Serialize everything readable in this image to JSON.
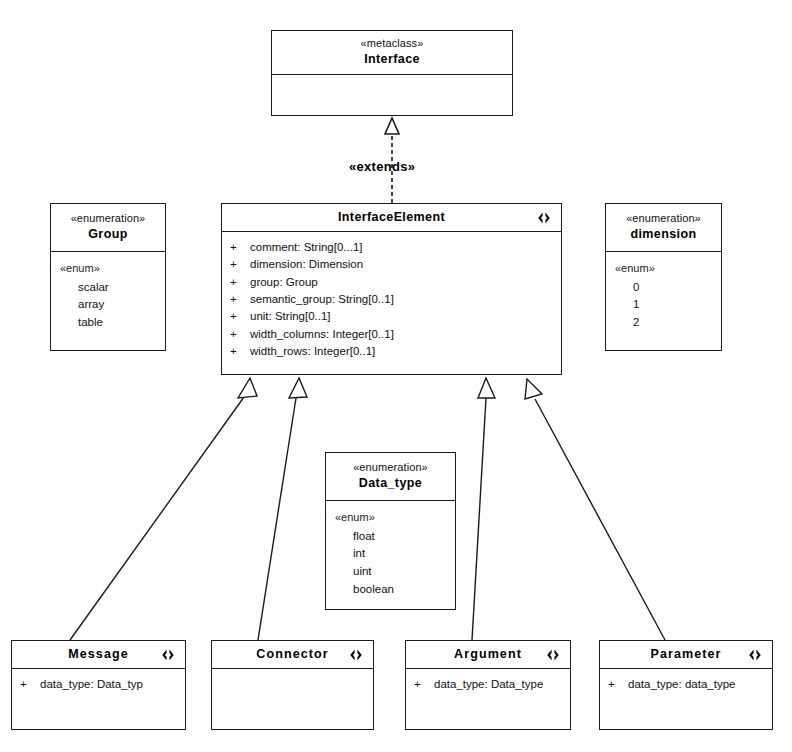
{
  "diagram": {
    "edge_labels": {
      "extends": "«extends»"
    },
    "icons": {
      "interface_marker": "interface-marker-icon"
    },
    "colors": {
      "line": "#1a1a1a",
      "background": "#ffffff",
      "text": "#111111"
    }
  },
  "nodes": {
    "interface": {
      "stereotype": "«metaclass»",
      "name": "Interface",
      "attributes": []
    },
    "interface_element": {
      "name": "InterfaceElement",
      "attributes": [
        {
          "visibility": "+",
          "text": "comment:  String[0...1]"
        },
        {
          "visibility": "+",
          "text": "dimension:  Dimension"
        },
        {
          "visibility": "+",
          "text": "group:  Group"
        },
        {
          "visibility": "+",
          "text": "semantic_group:  String[0..1]"
        },
        {
          "visibility": "+",
          "text": "unit:  String[0..1]"
        },
        {
          "visibility": "+",
          "text": "width_columns:  Integer[0..1]"
        },
        {
          "visibility": "+",
          "text": "width_rows:  Integer[0..1]"
        }
      ]
    },
    "group_enum": {
      "stereotype": "«enumeration»",
      "name": "Group",
      "enum_keyword": "«enum»",
      "literals": [
        "scalar",
        "array",
        "table"
      ]
    },
    "dimension_enum": {
      "stereotype": "«enumeration»",
      "name": "dimension",
      "enum_keyword": "«enum»",
      "literals": [
        "0",
        "1",
        "2"
      ]
    },
    "data_type_enum": {
      "stereotype": "«enumeration»",
      "name": "Data_type",
      "enum_keyword": "«enum»",
      "literals": [
        "float",
        "int",
        "uint",
        "boolean"
      ]
    },
    "message": {
      "name": "Message",
      "attributes": [
        {
          "visibility": "+",
          "text": "data_type:  Data_typ"
        }
      ]
    },
    "connector": {
      "name": "Connector",
      "attributes": []
    },
    "argument": {
      "name": "Argument",
      "attributes": [
        {
          "visibility": "+",
          "text": "data_type:  Data_type"
        }
      ]
    },
    "parameter": {
      "name": "Parameter",
      "attributes": [
        {
          "visibility": "+",
          "text": "data_type:  data_type"
        }
      ]
    }
  }
}
